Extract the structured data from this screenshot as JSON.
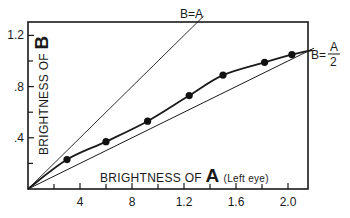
{
  "chart_data": {
    "type": "scatter",
    "title": "",
    "xlabel_prefix": "BRIGHTNESS OF ",
    "xlabel_big": "A",
    "xlabel_note": "(Left eye)",
    "ylabel_prefix": "BRIGHTNESS OF ",
    "ylabel_big": "B",
    "xlim": [
      0,
      2.15
    ],
    "ylim": [
      0,
      1.3
    ],
    "x_ticks": [
      {
        "value": 0.4,
        "label": "4"
      },
      {
        "value": 0.8,
        "label": "8"
      },
      {
        "value": 1.2,
        "label": "1.2"
      },
      {
        "value": 1.6,
        "label": "1.6"
      },
      {
        "value": 2.0,
        "label": "2.0"
      }
    ],
    "x_minor_ticks": [
      0.2,
      0.6,
      1.0,
      1.4,
      1.8
    ],
    "y_ticks": [
      {
        "value": 0.4,
        "label": ".4"
      },
      {
        "value": 0.8,
        "label": ".8"
      },
      {
        "value": 1.2,
        "label": "1.2"
      }
    ],
    "y_minor_ticks": [
      0.2,
      0.6,
      1.0
    ],
    "grid": false,
    "series": [
      {
        "name": "Measured",
        "kind": "points_with_fitted_curve",
        "x": [
          0.3,
          0.6,
          0.92,
          1.24,
          1.5,
          1.82,
          2.03
        ],
        "y": [
          0.23,
          0.37,
          0.53,
          0.73,
          0.89,
          0.99,
          1.05
        ]
      },
      {
        "name": "B=A",
        "kind": "reference_line",
        "slope": 1.0
      },
      {
        "name": "B=A/2",
        "kind": "reference_line",
        "slope": 0.5
      }
    ],
    "annotations": [
      {
        "text": "B=A",
        "position": "top, at end of B=A line"
      },
      {
        "text": "B= A/2",
        "position": "right, at end of B=A/2 line"
      }
    ]
  },
  "labels": {
    "line_b_eq_a": "B=A",
    "line_half_prefix": "B=",
    "line_half_num": "A",
    "line_half_den": "2"
  }
}
